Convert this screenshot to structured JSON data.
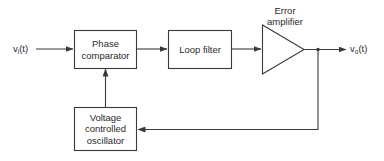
{
  "diagram": {
    "type": "block-diagram",
    "colors": {
      "stroke": "#3a3a3a",
      "text": "#2a2a2a",
      "background": "#ffffff"
    },
    "signals": {
      "input": {
        "base": "v",
        "sub": "i",
        "suffix": "(t)"
      },
      "output": {
        "base": "v",
        "sub": "o",
        "suffix": "(t)"
      }
    },
    "blocks": {
      "phase_comparator": {
        "line1": "Phase",
        "line2": "comparator"
      },
      "loop_filter": {
        "line1": "Loop filter"
      },
      "error_amplifier": {
        "line1": "Error",
        "line2": "amplifier"
      },
      "vco": {
        "line1": "Voltage",
        "line2": "controlled",
        "line3": "oscillator"
      }
    },
    "connections": [
      {
        "from": "input",
        "to": "phase_comparator"
      },
      {
        "from": "phase_comparator",
        "to": "loop_filter"
      },
      {
        "from": "loop_filter",
        "to": "error_amplifier"
      },
      {
        "from": "error_amplifier",
        "to": "output"
      },
      {
        "from": "error_amplifier",
        "to": "vco",
        "kind": "feedback"
      },
      {
        "from": "vco",
        "to": "phase_comparator"
      }
    ]
  }
}
